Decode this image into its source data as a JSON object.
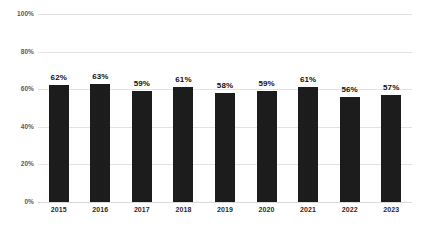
{
  "chart_data": {
    "type": "bar",
    "title": "",
    "subtitle": "",
    "xlabel": "",
    "ylabel": "",
    "categories": [
      "2015",
      "2016",
      "2017",
      "2018",
      "2019",
      "2020",
      "2021",
      "2022",
      "2023"
    ],
    "values": [
      62,
      63,
      59,
      61,
      58,
      59,
      61,
      56,
      57
    ],
    "value_labels": [
      "62%",
      "63%",
      "59%",
      "61%",
      "58%",
      "59%",
      "61%",
      "56%",
      "57%"
    ],
    "ylim": [
      0,
      100
    ],
    "ytick_values": [
      0,
      20,
      40,
      60,
      80,
      100
    ],
    "ytick_labels": [
      "0%",
      "20%",
      "40%",
      "60%",
      "80%",
      "100%"
    ],
    "grid": true,
    "legend": false,
    "legend_position": "none",
    "series": [
      {
        "name": "",
        "values": [
          62,
          63,
          59,
          61,
          58,
          59,
          61,
          56,
          57
        ],
        "color": "#1c1c1c"
      }
    ],
    "colors": {
      "background": "#ffffff",
      "bar": "#1c1c1c",
      "gridline": "#e3e3e3",
      "baseline": "#d9d9d9",
      "ytick_label": "#5a5a5a",
      "xtick_label": "#2b2b2b",
      "value_label": "#111111"
    }
  }
}
